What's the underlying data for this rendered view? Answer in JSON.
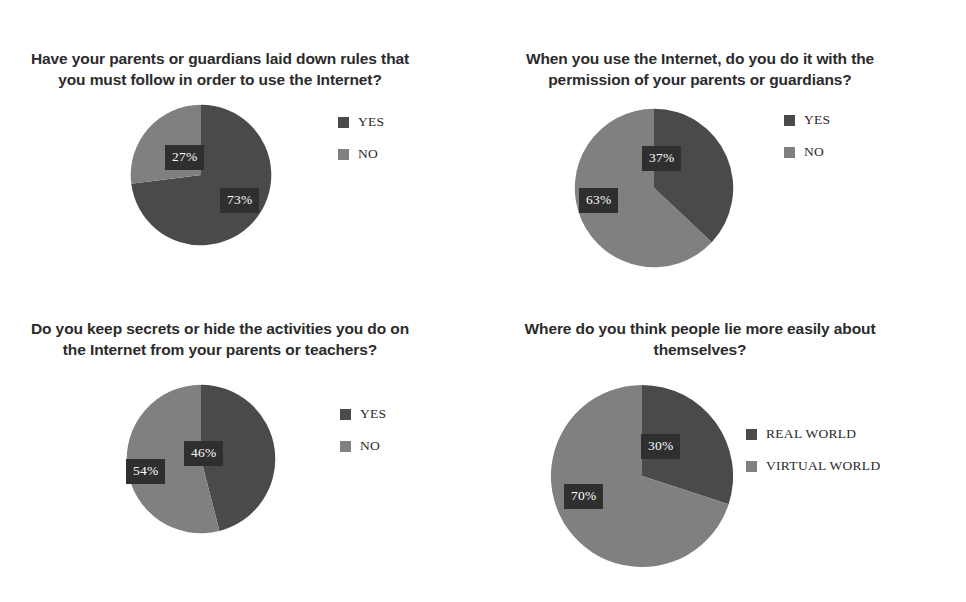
{
  "figure": {
    "background_color": "#ffffff",
    "dark_color": "#4a4a4a",
    "light_color": "#808080",
    "label_box_color": "#2f2f2f"
  },
  "charts": [
    {
      "id": "rules",
      "title": "Have your parents or guardians laid down rules that you must follow in order to use the Internet?",
      "legend": [
        {
          "label": "YES",
          "color": "#4a4a4a"
        },
        {
          "label": "NO",
          "color": "#808080"
        }
      ],
      "labels": {
        "yes": "73%",
        "no": "27%"
      }
    },
    {
      "id": "permission",
      "title": "When you use the Internet, do you do it with the permission of your parents or guardians?",
      "legend": [
        {
          "label": "YES",
          "color": "#4a4a4a"
        },
        {
          "label": "NO",
          "color": "#808080"
        }
      ],
      "labels": {
        "yes": "37%",
        "no": "63%"
      }
    },
    {
      "id": "secrets",
      "title": "Do you keep secrets or hide the activities you do on the Internet from your parents or teachers?",
      "legend": [
        {
          "label": "YES",
          "color": "#4a4a4a"
        },
        {
          "label": "NO",
          "color": "#808080"
        }
      ],
      "labels": {
        "yes": "46%",
        "no": "54%"
      }
    },
    {
      "id": "lying",
      "title": "Where do you think people lie more easily about themselves?",
      "legend": [
        {
          "label": "REAL WORLD",
          "color": "#4a4a4a"
        },
        {
          "label": "VIRTUAL WORLD",
          "color": "#808080"
        }
      ],
      "labels": {
        "real": "30%",
        "virtual": "70%"
      }
    }
  ],
  "chart_data": [
    {
      "type": "pie",
      "title": "Have your parents or guardians laid down rules that you must follow in order to use the Internet?",
      "categories": [
        "YES",
        "NO"
      ],
      "values": [
        73,
        27
      ],
      "value_labels": [
        "73%",
        "27%"
      ],
      "unit": "percent",
      "start_angle": 90,
      "direction": "clockwise",
      "colors": [
        "#4a4a4a",
        "#808080"
      ],
      "legend_position": "right",
      "grid": false
    },
    {
      "type": "pie",
      "title": "When you use the Internet, do you do it with the permission of your parents or guardians?",
      "categories": [
        "YES",
        "NO"
      ],
      "values": [
        37,
        63
      ],
      "value_labels": [
        "37%",
        "63%"
      ],
      "unit": "percent",
      "start_angle": 90,
      "direction": "clockwise",
      "colors": [
        "#4a4a4a",
        "#808080"
      ],
      "legend_position": "right",
      "grid": false
    },
    {
      "type": "pie",
      "title": "Do you keep secrets or hide the activities you do on the Internet from your parents or teachers?",
      "categories": [
        "YES",
        "NO"
      ],
      "values": [
        46,
        54
      ],
      "value_labels": [
        "46%",
        "54%"
      ],
      "unit": "percent",
      "start_angle": 90,
      "direction": "clockwise",
      "colors": [
        "#4a4a4a",
        "#808080"
      ],
      "legend_position": "right",
      "grid": false
    },
    {
      "type": "pie",
      "title": "Where do you think people lie more easily about themselves?",
      "categories": [
        "REAL WORLD",
        "VIRTUAL WORLD"
      ],
      "values": [
        30,
        70
      ],
      "value_labels": [
        "30%",
        "70%"
      ],
      "unit": "percent",
      "start_angle": 90,
      "direction": "clockwise",
      "colors": [
        "#4a4a4a",
        "#808080"
      ],
      "legend_position": "right",
      "grid": false
    }
  ]
}
